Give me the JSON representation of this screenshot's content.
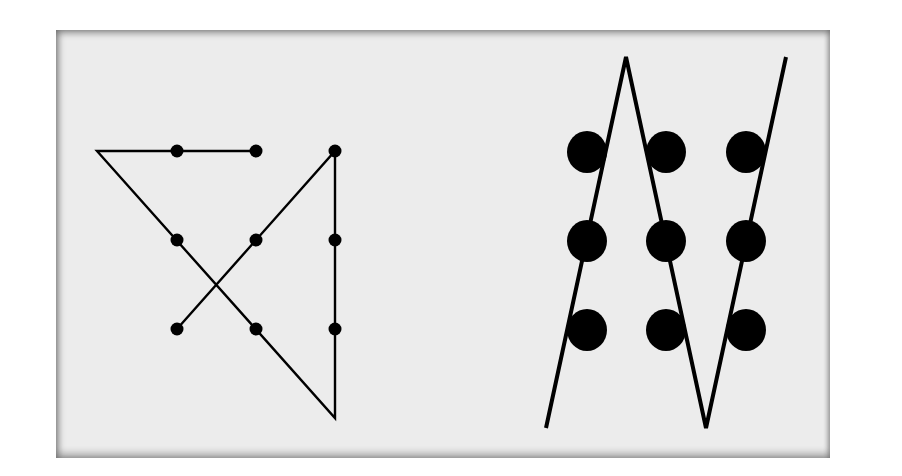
{
  "colors": {
    "ink": "#000000",
    "panel": "#ececec"
  },
  "figures": [
    {
      "name": "small-dots-four-line-solution",
      "description": "3x3 grid of small dots connected by four straight lines extending beyond the grid",
      "dot_style": "small",
      "grid": {
        "rows": 3,
        "cols": 3
      },
      "path_points": [
        [
          0,
          0.0
        ],
        [
          -1,
          0
        ],
        [
          2,
          3.0
        ],
        [
          2,
          0
        ],
        [
          0,
          2
        ]
      ],
      "path_units": "grid cells; dot centers at integer coordinates 0..2, path begins at dot (0,0) top-row second-left conceptually"
    },
    {
      "name": "large-dots-three-line-solution",
      "description": "3x3 grid of large dots crossed by three long zigzag lines",
      "dot_style": "large",
      "grid": {
        "rows": 3,
        "cols": 3
      },
      "segments": 3
    }
  ]
}
